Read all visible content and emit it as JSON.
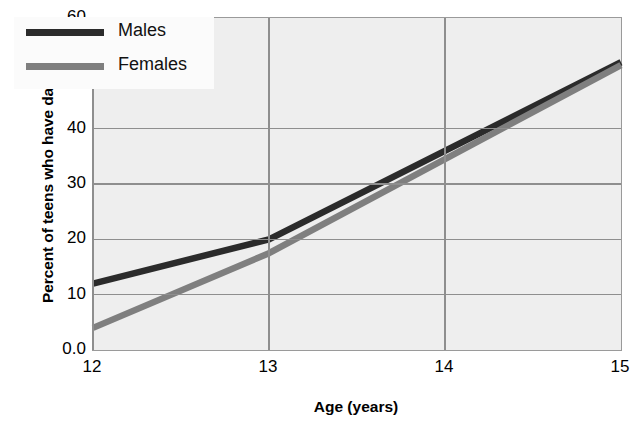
{
  "chart_data": {
    "type": "line",
    "title": "",
    "xlabel": "Age (years)",
    "ylabel": "Percent of teens who have dated",
    "xlim": [
      12,
      15
    ],
    "ylim": [
      0,
      60
    ],
    "grid": true,
    "legend_position": "upper-left",
    "x_ticks": [
      "12",
      "13",
      "14",
      "15"
    ],
    "x_tick_values": [
      12,
      13,
      14,
      15
    ],
    "y_ticks": [
      "0.0",
      "10",
      "20",
      "30",
      "40",
      "50",
      "60"
    ],
    "y_tick_values": [
      0,
      10,
      20,
      30,
      40,
      50,
      60
    ],
    "series": [
      {
        "name": "Males",
        "color": "#2b2b2b",
        "x": [
          12,
          13,
          15
        ],
        "values": [
          12,
          20,
          52
        ]
      },
      {
        "name": "Females",
        "color": "#7f7f7f",
        "x": [
          12,
          13,
          15
        ],
        "values": [
          4,
          17.5,
          51.5
        ]
      }
    ]
  },
  "legend": {
    "items": [
      {
        "label": "Males",
        "color": "#2b2b2b"
      },
      {
        "label": "Females",
        "color": "#7f7f7f"
      }
    ]
  },
  "style": {
    "plot_background": "#eeeeee",
    "grid_color": "#8e8e8e",
    "axis_color": "#9a9a9a",
    "text_color": "#000000",
    "figure_background": "#ffffff"
  }
}
